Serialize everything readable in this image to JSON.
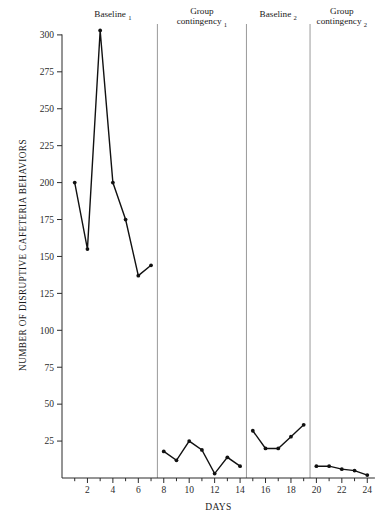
{
  "chart_data": {
    "type": "line",
    "title": "",
    "xlabel": "DAYS",
    "ylabel": "NUMBER OF DISRUPTIVE CAFETERIA BEHAVIORS",
    "xlim": [
      0,
      25
    ],
    "ylim": [
      0,
      310
    ],
    "grid": false,
    "legend": "none",
    "x_tick_labels": [
      "2",
      "4",
      "6",
      "8",
      "10",
      "12",
      "14",
      "16",
      "18",
      "20",
      "22",
      "24"
    ],
    "x_tick_values": [
      2,
      4,
      6,
      8,
      10,
      12,
      14,
      16,
      18,
      20,
      22,
      24
    ],
    "x_minor_ticks": [
      1,
      3,
      5,
      7,
      9,
      11,
      13,
      15,
      17,
      19,
      21,
      23
    ],
    "y_tick_labels": [
      "25",
      "50",
      "75",
      "100",
      "125",
      "150",
      "175",
      "200",
      "225",
      "250",
      "275",
      "300"
    ],
    "y_tick_values": [
      25,
      50,
      75,
      100,
      125,
      150,
      175,
      200,
      225,
      250,
      275,
      300
    ],
    "x": [
      1,
      2,
      3,
      4,
      5,
      6,
      7,
      8,
      9,
      10,
      11,
      12,
      13,
      14,
      15,
      16,
      17,
      18,
      19,
      20,
      21,
      22,
      23,
      24
    ],
    "values": [
      200,
      155,
      303,
      200,
      175,
      137,
      144,
      18,
      12,
      25,
      19,
      3,
      14,
      8,
      32,
      20,
      20,
      28,
      36,
      8,
      8,
      6,
      5,
      2
    ],
    "segments": [
      {
        "phase": "Baseline 1",
        "x": [
          1,
          2,
          3,
          4,
          5,
          6,
          7
        ],
        "values": [
          200,
          155,
          303,
          200,
          175,
          137,
          144
        ]
      },
      {
        "phase": "Group contingency 1",
        "x": [
          8,
          9,
          10,
          11,
          12,
          13,
          14
        ],
        "values": [
          18,
          12,
          25,
          19,
          3,
          14,
          8
        ]
      },
      {
        "phase": "Baseline 2",
        "x": [
          15,
          16,
          17,
          18,
          19
        ],
        "values": [
          32,
          20,
          20,
          28,
          36
        ]
      },
      {
        "phase": "Group contingency 2",
        "x": [
          20,
          21,
          22,
          23,
          24
        ],
        "values": [
          8,
          8,
          6,
          5,
          2
        ]
      }
    ],
    "phase_dividers_x": [
      7.5,
      14.5,
      19.5
    ],
    "phase_labels": [
      {
        "base": "Baseline",
        "subscript": "1",
        "center_x": 4.0,
        "two_line": false
      },
      {
        "base": "Group",
        "base2": "contingency",
        "subscript": "1",
        "center_x": 11.0,
        "two_line": true
      },
      {
        "base": "Baseline",
        "subscript": "2",
        "center_x": 17.0,
        "two_line": false
      },
      {
        "base": "Group",
        "base2": "contingency",
        "subscript": "2",
        "center_x": 22.0,
        "two_line": true
      }
    ]
  },
  "colors": {
    "line": "#111111",
    "point": "#111111",
    "axis": "#2b2b2b",
    "divider": "#9a9a9a",
    "background": "#ffffff"
  }
}
